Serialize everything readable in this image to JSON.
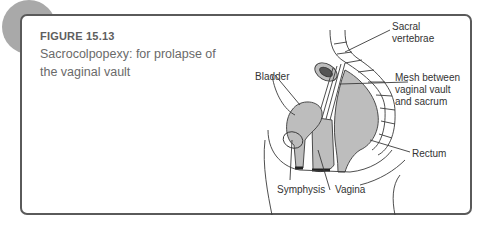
{
  "figure": {
    "number": "FIGURE 15.13",
    "caption": "Sacrocolpopexy: for prolapse of the vaginal vault"
  },
  "diagram": {
    "labels": {
      "sacral_1": "Sacral",
      "sacral_2": "vertebrae",
      "mesh_1": "Mesh between",
      "mesh_2": "vaginal vault",
      "mesh_3": "and sacrum",
      "bladder": "Bladder",
      "rectum": "Rectum",
      "symphysis": "Symphysis",
      "vagina": "Vagina"
    },
    "colors": {
      "organ_fill": "#bdbdbd",
      "line": "#3a3a3a",
      "frame": "#5a5a5a",
      "badge": "#a9a9a9"
    }
  }
}
